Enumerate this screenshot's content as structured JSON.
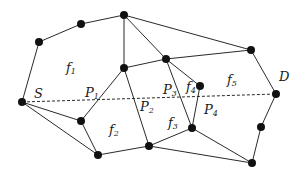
{
  "diagram": {
    "nodes": [
      {
        "id": "N1",
        "x": 39,
        "y": 42
      },
      {
        "id": "N2",
        "x": 81,
        "y": 24
      },
      {
        "id": "N3",
        "x": 124,
        "y": 15
      },
      {
        "id": "N4",
        "x": 166,
        "y": 59
      },
      {
        "id": "N5",
        "x": 251,
        "y": 50
      },
      {
        "id": "N6",
        "x": 124,
        "y": 68
      },
      {
        "id": "N7",
        "x": 200,
        "y": 86
      },
      {
        "id": "S",
        "x": 22,
        "y": 102
      },
      {
        "id": "D",
        "x": 276,
        "y": 94
      },
      {
        "id": "N10",
        "x": 81,
        "y": 121
      },
      {
        "id": "N11",
        "x": 98,
        "y": 155
      },
      {
        "id": "N12",
        "x": 149,
        "y": 146
      },
      {
        "id": "N13",
        "x": 192,
        "y": 128
      },
      {
        "id": "N14",
        "x": 261,
        "y": 127
      },
      {
        "id": "N15",
        "x": 252,
        "y": 163
      }
    ],
    "edges": [
      [
        "S",
        "N1"
      ],
      [
        "N1",
        "N2"
      ],
      [
        "N2",
        "N3"
      ],
      [
        "N3",
        "N6"
      ],
      [
        "N3",
        "N4"
      ],
      [
        "N3",
        "N5"
      ],
      [
        "N5",
        "N4"
      ],
      [
        "N4",
        "N6"
      ],
      [
        "N5",
        "D"
      ],
      [
        "D",
        "N14"
      ],
      [
        "N14",
        "N15"
      ],
      [
        "N15",
        "N13"
      ],
      [
        "N15",
        "N12"
      ],
      [
        "N12",
        "N11"
      ],
      [
        "N11",
        "S"
      ],
      [
        "S",
        "N10"
      ],
      [
        "N10",
        "N11"
      ],
      [
        "N10",
        "N6"
      ],
      [
        "N6",
        "N12"
      ],
      [
        "N4",
        "N13"
      ],
      [
        "N4",
        "N7"
      ],
      [
        "N7",
        "N13"
      ],
      [
        "N13",
        "N12"
      ]
    ],
    "dashed_path": {
      "from": "S",
      "to": "D"
    },
    "labels": {
      "S": {
        "text": "S",
        "x": 34,
        "y": 87
      },
      "D": {
        "text": "D",
        "x": 279,
        "y": 70
      },
      "f1": {
        "base": "f",
        "sub": "1",
        "x": 66,
        "y": 61
      },
      "f2": {
        "base": "f",
        "sub": "2",
        "x": 109,
        "y": 123
      },
      "f3": {
        "base": "f",
        "sub": "3",
        "x": 168,
        "y": 116
      },
      "f4": {
        "base": "f",
        "sub": "4",
        "x": 186,
        "y": 80
      },
      "f5": {
        "base": "f",
        "sub": "5",
        "x": 227,
        "y": 73
      },
      "P1": {
        "base": "P",
        "sub": "1",
        "x": 85,
        "y": 86
      },
      "P2": {
        "base": "P",
        "sub": "2",
        "x": 140,
        "y": 100
      },
      "P3": {
        "base": "P",
        "sub": "3",
        "x": 163,
        "y": 83
      },
      "P4": {
        "base": "P",
        "sub": "4",
        "x": 204,
        "y": 103
      }
    }
  },
  "colors": {
    "background": "#ffffff",
    "edge": "#2a2a2a",
    "node": "#111111"
  }
}
